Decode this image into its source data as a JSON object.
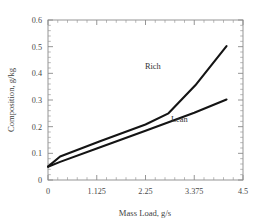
{
  "chart_data": {
    "type": "line",
    "title": "",
    "xlabel": "Mass Load, g/s",
    "ylabel": "Composition, g/kg",
    "xlim": [
      0,
      4.5
    ],
    "ylim": [
      0,
      0.6
    ],
    "grid": false,
    "legend_position": "inline-annotations",
    "x_ticks": [
      0,
      1.125,
      2.25,
      3.375,
      4.5
    ],
    "x_tick_labels": [
      "0",
      "1.125",
      "2.25",
      "3.375",
      "4.5"
    ],
    "y_ticks": [
      0,
      0.1,
      0.2,
      0.3,
      0.4,
      0.5,
      0.6
    ],
    "y_tick_labels": [
      "0",
      "0.1",
      "0.2",
      "0.3",
      "0.4",
      "0.5",
      "0.6"
    ],
    "x_minor_tick_count": 4,
    "y_minor_tick_count": 4,
    "series": [
      {
        "name": "Rich",
        "label": "Rich",
        "color": "#141414",
        "x": [
          0,
          0.28,
          1.2,
          2.25,
          2.78,
          3.4,
          4.12
        ],
        "y": [
          0.05,
          0.088,
          0.145,
          0.208,
          0.25,
          0.355,
          0.502
        ]
      },
      {
        "name": "Lean",
        "label": "Lean",
        "color": "#141414",
        "x": [
          0,
          0.28,
          1.125,
          2.25,
          3.375,
          4.12
        ],
        "y": [
          0.05,
          0.068,
          0.118,
          0.185,
          0.252,
          0.302
        ]
      }
    ],
    "annotations": [
      {
        "text": "Rich",
        "x": 2.42,
        "y": 0.418
      },
      {
        "text": "Lean",
        "x": 3.03,
        "y": 0.218
      }
    ]
  },
  "axes": {
    "x_title": "Mass Load, g/s",
    "y_title": "Composition, g/kg"
  }
}
